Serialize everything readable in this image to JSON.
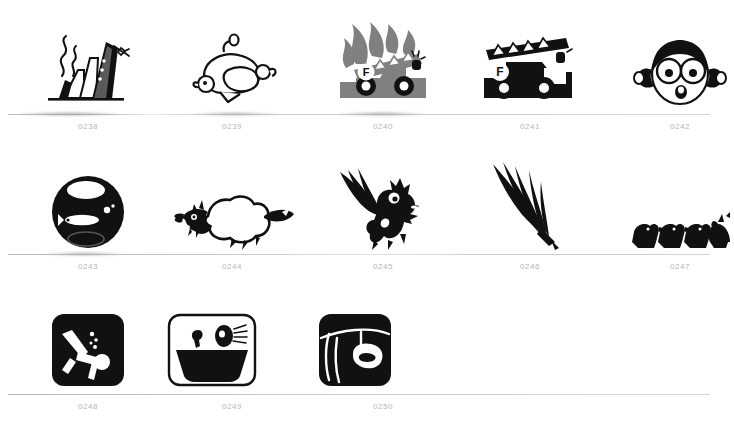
{
  "page": {
    "background_color": "#ffffff",
    "label_color": "#b6b6b6",
    "rule_color": "#cfcfcf",
    "ink_color": "#111111",
    "gray_ink_color": "#808080",
    "width": 718,
    "height": 447
  },
  "rows": [
    {
      "row_index": 0,
      "items": [
        {
          "id": "0238",
          "label": "0238",
          "icon": "sinking-ship-icon",
          "center_x": 88,
          "tone": "black"
        },
        {
          "id": "0239",
          "label": "0239",
          "icon": "roast-turkey-icon",
          "center_x": 232,
          "tone": "outline"
        },
        {
          "id": "0240",
          "label": "0240",
          "icon": "burning-fire-truck-icon",
          "center_x": 383,
          "tone": "gray"
        },
        {
          "id": "0241",
          "label": "0241",
          "icon": "fire-truck-icon",
          "center_x": 530,
          "tone": "black"
        },
        {
          "id": "0242",
          "label": "0242",
          "icon": "girl-face-icon",
          "center_x": 680,
          "tone": "black"
        }
      ]
    },
    {
      "row_index": 1,
      "items": [
        {
          "id": "0243",
          "label": "0243",
          "icon": "fishbowl-icon",
          "center_x": 88,
          "tone": "black"
        },
        {
          "id": "0244",
          "label": "0244",
          "icon": "sheep-icon",
          "center_x": 232,
          "tone": "black"
        },
        {
          "id": "0245",
          "label": "0245",
          "icon": "winged-cat-icon",
          "center_x": 383,
          "tone": "black"
        },
        {
          "id": "0246",
          "label": "0246",
          "icon": "feather-quill-icon",
          "center_x": 530,
          "tone": "black"
        },
        {
          "id": "0247",
          "label": "0247",
          "icon": "duck-row-icon",
          "center_x": 680,
          "tone": "black"
        }
      ]
    },
    {
      "row_index": 2,
      "items": [
        {
          "id": "0248",
          "label": "0248",
          "icon": "scuba-diver-badge-icon",
          "center_x": 88,
          "tone": "black"
        },
        {
          "id": "0249",
          "label": "0249",
          "icon": "bathtub-badge-icon",
          "center_x": 212,
          "tone": "outline"
        },
        {
          "id": "0250",
          "label": "0250",
          "icon": "laundry-line-badge-icon",
          "center_x": 355,
          "tone": "black"
        }
      ]
    }
  ]
}
